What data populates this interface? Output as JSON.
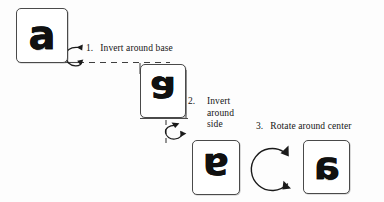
{
  "figure": {
    "background_color": "#fdfdfd",
    "ink_color": "#151515",
    "line_color": "#4a4a4a"
  },
  "cards": [
    {
      "id": "card-a1",
      "letter": "a",
      "name": "letter-card-a-original",
      "orientation": "upright"
    },
    {
      "id": "card-g",
      "letter": "a",
      "name": "letter-card-inverted-base",
      "orientation": "flipped-vertical"
    },
    {
      "id": "card-e",
      "letter": "a",
      "name": "letter-card-inverted-side",
      "orientation": "flipped-both"
    },
    {
      "id": "card-a2",
      "letter": "a",
      "name": "letter-card-rotated",
      "orientation": "flipped-horizontal"
    }
  ],
  "steps": [
    {
      "number": "1.",
      "text": "Invert around base",
      "lines": [
        "Invert around base"
      ]
    },
    {
      "number": "2.",
      "text": "Invert around side",
      "lines": [
        "Invert",
        "around",
        "side"
      ]
    },
    {
      "number": "3.",
      "text": "Rotate around center",
      "lines": [
        "Rotate around center"
      ]
    }
  ],
  "arrows": [
    {
      "name": "curl-arrow-horizontal-axis",
      "kind": "curl",
      "axis": "horizontal"
    },
    {
      "name": "curl-arrow-vertical-axis",
      "kind": "curl",
      "axis": "vertical"
    },
    {
      "name": "circular-rotate-arrow",
      "kind": "circle",
      "axis": "center"
    }
  ]
}
